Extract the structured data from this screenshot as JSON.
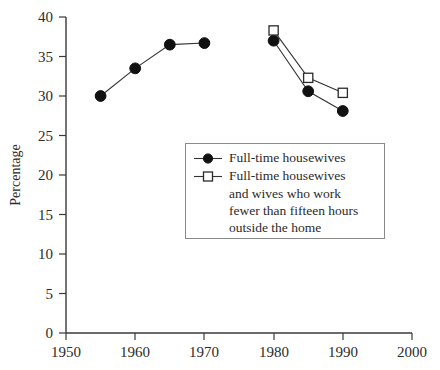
{
  "chart_data": {
    "type": "line",
    "title": "",
    "xlabel": "",
    "ylabel": "Percentage",
    "xlim": [
      1950,
      2000
    ],
    "ylim": [
      0,
      40
    ],
    "xticks": [
      1950,
      1960,
      1970,
      1980,
      1990,
      2000
    ],
    "yticks": [
      0,
      5,
      10,
      15,
      20,
      25,
      30,
      35,
      40
    ],
    "grid": false,
    "legend_position": "center",
    "series": [
      {
        "name": "Full-time housewives",
        "marker": "filled-circle",
        "segments": [
          {
            "x": [
              1955,
              1960,
              1965,
              1970
            ],
            "y": [
              30.0,
              33.5,
              36.5,
              36.7
            ]
          },
          {
            "x": [
              1980,
              1985,
              1990
            ],
            "y": [
              37.0,
              30.6,
              28.1
            ]
          }
        ]
      },
      {
        "name": "Full-time housewives and wives who work fewer than fifteen hours outside the home",
        "marker": "open-square",
        "segments": [
          {
            "x": [
              1980,
              1985,
              1990
            ],
            "y": [
              38.3,
              32.3,
              30.4
            ]
          }
        ]
      }
    ]
  },
  "axes": {
    "y_title": "Percentage",
    "y_tick_labels": [
      "40",
      "35",
      "30",
      "25",
      "20",
      "15",
      "10",
      "5",
      "0"
    ],
    "x_tick_labels": [
      "1950",
      "1960",
      "1970",
      "1980",
      "1990",
      "2000"
    ]
  },
  "legend": {
    "entries": [
      {
        "marker": "filled-circle",
        "lines": [
          "Full-time housewives"
        ]
      },
      {
        "marker": "open-square",
        "lines": [
          "Full-time housewives",
          "and wives who work",
          "fewer than fifteen hours",
          "outside the home"
        ]
      }
    ]
  },
  "colors": {
    "background": "#ffffff",
    "axis": "#3a3a3a",
    "series_line": "#333333",
    "marker_filled": "#111111",
    "marker_open_fill": "#ffffff",
    "marker_open_stroke": "#2b2b2b",
    "legend_border": "#8a8a8a",
    "text": "#2b2b2b"
  }
}
